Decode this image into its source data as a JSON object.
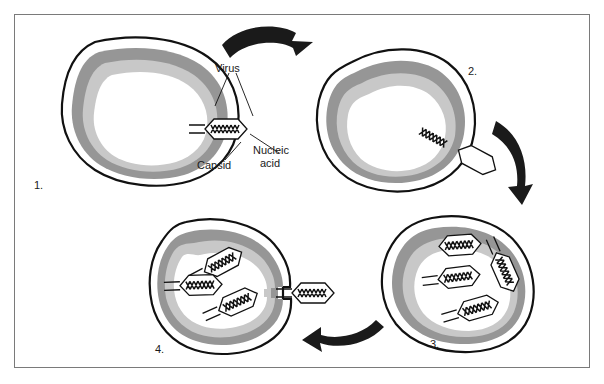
{
  "diagram": {
    "background": "#ffffff",
    "frame_color": "#7a7a7a",
    "colors": {
      "outline": "#111111",
      "cell_outer_band": "#969696",
      "cell_inner_band": "#c8c8c8",
      "cell_interior": "#ffffff",
      "arrow": "#1a1a1a",
      "text": "#1a1a1a"
    }
  },
  "labels": {
    "virus": "Virus",
    "capsid": "Capsid",
    "nucleic_acid_line1": "Nucleic",
    "nucleic_acid_line2": "acid"
  },
  "stages": [
    {
      "number": "1.",
      "caption": "Virus attaches to host cell surface"
    },
    {
      "number": "2.",
      "caption": "Nucleic acid is injected into host cell; empty capsid remains outside"
    },
    {
      "number": "3.",
      "caption": "New virus particles are assembled inside the host cell"
    },
    {
      "number": "4.",
      "caption": "New viruses are released from the host cell"
    }
  ],
  "arrows": [
    {
      "name": "arrow-stage1-to-stage2",
      "direction": "right"
    },
    {
      "name": "arrow-stage2-to-stage3",
      "direction": "down"
    },
    {
      "name": "arrow-stage3-to-stage4",
      "direction": "left"
    }
  ],
  "virus_counts": {
    "stage1": 1,
    "stage2": 1,
    "stage3": 4,
    "stage4": 4
  }
}
